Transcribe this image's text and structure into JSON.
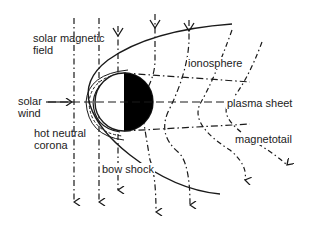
{
  "diagram": {
    "labels": {
      "solar_magnetic_field_line1": "solar magnetic",
      "solar_magnetic_field_line2": "field",
      "solar_wind_line1": "solar",
      "solar_wind_line2": "wind",
      "hot_neutral_corona_line1": "hot neutral",
      "hot_neutral_corona_line2": "corona",
      "bow_shock": "bow shock",
      "ionosphere": "ionosphere",
      "plasma_sheet": "plasma sheet",
      "magnetotail": "magnetotail"
    },
    "colors": {
      "line": "#1a1a1a",
      "body_dark": "#000000",
      "background": "#ffffff"
    }
  }
}
